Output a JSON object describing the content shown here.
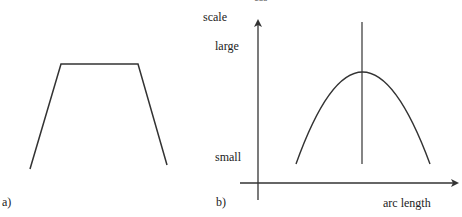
{
  "header_fragment": "css",
  "panel_a": {
    "label": "a)",
    "shape": "trapezoid",
    "points": [
      [
        30,
        169
      ],
      [
        61,
        64
      ],
      [
        138,
        64
      ],
      [
        167,
        165
      ]
    ]
  },
  "panel_b": {
    "label": "b)",
    "y_axis": {
      "title": "scale",
      "ticks": [
        "large",
        "small"
      ]
    },
    "x_axis": {
      "title": "arc length"
    },
    "curve": "parabola",
    "curve_points": {
      "left": [
        296,
        164
      ],
      "peak": [
        362,
        72
      ],
      "right": [
        430,
        164
      ]
    },
    "marker_line_x": 362
  },
  "colors": {
    "stroke": "#333333",
    "text": "#222222"
  }
}
